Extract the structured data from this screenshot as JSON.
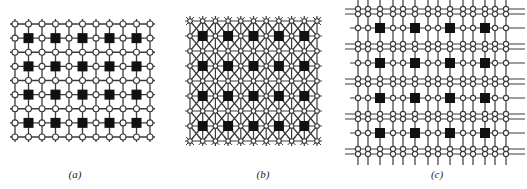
{
  "figure": {
    "panels": [
      {
        "id": "a",
        "label": "(a)",
        "type": "mesh",
        "description": "Square grid of routing nodes (open circles) with processing elements (black squares)",
        "grid_columns": 11,
        "grid_rows": 9,
        "pe_columns": 5,
        "pe_rows": 4
      },
      {
        "id": "b",
        "label": "(b)",
        "type": "mesh-with-diagonals",
        "description": "Grid with diagonal interconnect links; nodes as small circles, processing elements as black squares",
        "grid_columns": 11,
        "grid_rows": 9,
        "pe_columns": 5,
        "pe_rows": 4
      },
      {
        "id": "c",
        "label": "(c)",
        "type": "multi-track-mesh",
        "description": "Grid with paired routing tracks between processing elements",
        "pe_columns": 4,
        "pe_rows": 4
      }
    ],
    "colors": {
      "line": "#3a3a3a",
      "node_fill": "#ffffff",
      "node_stroke": "#3a3a3a",
      "pe_fill": "#111111",
      "background": "#ffffff"
    }
  }
}
